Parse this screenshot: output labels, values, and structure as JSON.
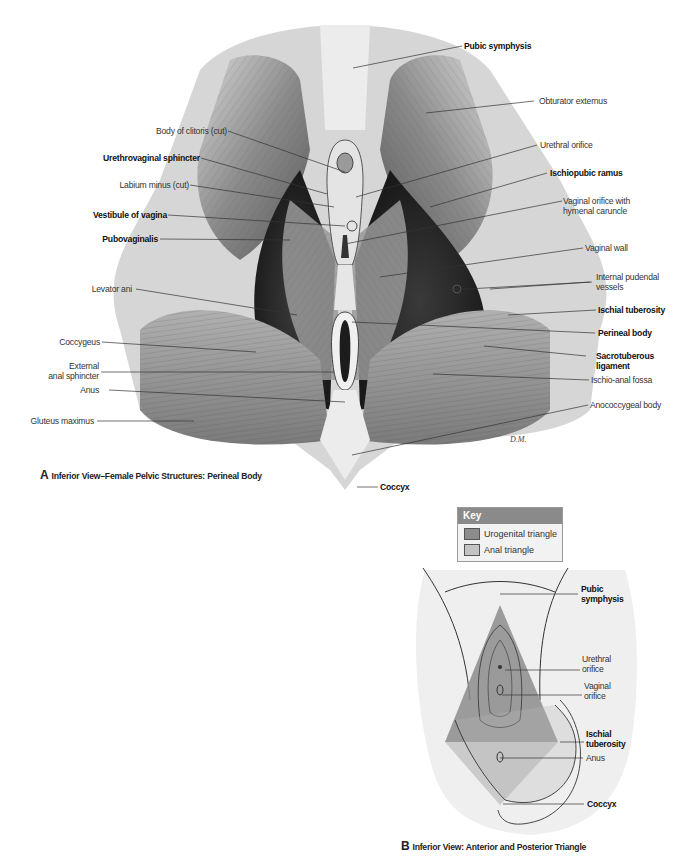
{
  "panel_a": {
    "caption_letter": "A",
    "caption": "Inferior View–Female Pelvic Structures: Perineal Body",
    "artist_signature": "D.M.",
    "labels_left": [
      {
        "text": "Body of clitoris (cut)",
        "bold": false
      },
      {
        "text": "Urethrovaginal sphincter",
        "bold": true
      },
      {
        "text": "Labium minus (cut)",
        "bold": false
      },
      {
        "text": "Vestibule of vagina",
        "bold": true
      },
      {
        "text": "Pubovaginalis",
        "bold": true
      },
      {
        "text": "Levator ani",
        "bold": false
      },
      {
        "text": "Coccygeus",
        "bold": false
      },
      {
        "text": "External anal sphincter",
        "bold": false
      },
      {
        "text": "Anus",
        "bold": false
      },
      {
        "text": "Gluteus maximus",
        "bold": false
      }
    ],
    "labels_right": [
      {
        "text": "Pubic symphysis",
        "bold": true
      },
      {
        "text": "Obturator externus",
        "bold": false
      },
      {
        "text": "Urethral orifice",
        "bold": false
      },
      {
        "text": "Ischiopubic ramus",
        "bold": true
      },
      {
        "text": "Vaginal orifice with hymenal caruncle",
        "bold": false
      },
      {
        "text": "Vaginal wall",
        "bold": false
      },
      {
        "text": "Internal pudendal vessels",
        "bold": false
      },
      {
        "text": "Ischial tuberosity",
        "bold": true
      },
      {
        "text": "Perineal body",
        "bold": true
      },
      {
        "text": "Sacrotuberous ligament",
        "bold": true
      },
      {
        "text": "Ischio-anal fossa",
        "bold": false
      },
      {
        "text": "Anococcygeal body",
        "bold": false
      }
    ],
    "label_bottom": {
      "text": "Coccyx",
      "bold": true
    }
  },
  "key": {
    "title": "Key",
    "items": [
      {
        "label": "Urogenital triangle",
        "color": "#8c8c8c"
      },
      {
        "label": "Anal triangle",
        "color": "#c4c4c4"
      }
    ]
  },
  "panel_b": {
    "caption_letter": "B",
    "caption": "Inferior View: Anterior and Posterior Triangle",
    "labels": [
      {
        "text": "Pubic symphysis",
        "bold": true
      },
      {
        "text": "Urethral orifice",
        "bold": false
      },
      {
        "text": "Vaginal orifice",
        "bold": false
      },
      {
        "text": "Ischial tuberosity",
        "bold": true
      },
      {
        "text": "Anus",
        "bold": false
      },
      {
        "text": "Coccyx",
        "bold": true
      }
    ]
  },
  "labels_split": {
    "ext_sphincter_1": "External",
    "ext_sphincter_2": "anal sphincter",
    "vag_orifice_1": "Vaginal orifice with",
    "vag_orifice_2": "hymenal caruncle",
    "int_pud_1": "Internal pudendal",
    "int_pud_2": "vessels",
    "sacro_1": "Sacrotuberous",
    "sacro_2": "ligament",
    "b_pubic_1": "Pubic",
    "b_pubic_2": "symphysis",
    "b_urethral_1": "Urethral",
    "b_urethral_2": "orifice",
    "b_vaginal_1": "Vaginal",
    "b_vaginal_2": "orifice",
    "b_isch_1": "Ischial",
    "b_isch_2": "tuberosity",
    "cut": "cut"
  }
}
